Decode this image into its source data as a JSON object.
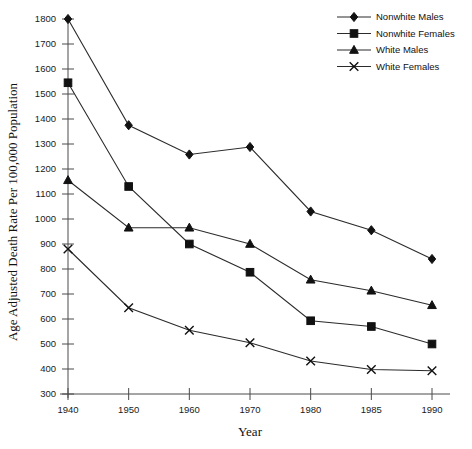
{
  "chart_data": {
    "type": "line",
    "title": "",
    "xlabel": "Year",
    "ylabel": "Age Adjusted Death Rate Per 100,000 Population",
    "categories": [
      "1940",
      "1950",
      "1960",
      "1970",
      "1980",
      "1985",
      "1990"
    ],
    "ylim": [
      300,
      1800
    ],
    "ytick_step": 100,
    "yticks": [
      "300",
      "400",
      "500",
      "600",
      "700",
      "800",
      "900",
      "1000",
      "1100",
      "1200",
      "1300",
      "1400",
      "1500",
      "1600",
      "1700",
      "1800"
    ],
    "grid": false,
    "legend_position": "top-right",
    "series": [
      {
        "name": "Nonwhite Males",
        "marker": "diamond",
        "values": [
          1800,
          1375,
          1258,
          1288,
          1030,
          955,
          840
        ]
      },
      {
        "name": "Nonwhite Females",
        "marker": "square",
        "values": [
          1545,
          1130,
          900,
          787,
          593,
          570,
          500
        ]
      },
      {
        "name": "White Males",
        "marker": "triangle",
        "values": [
          1155,
          965,
          965,
          900,
          757,
          713,
          655
        ]
      },
      {
        "name": "White Females",
        "marker": "x",
        "values": [
          880,
          645,
          555,
          505,
          432,
          398,
          393
        ]
      }
    ]
  },
  "legend": {
    "items": [
      {
        "label": "Nonwhite Males",
        "marker": "diamond"
      },
      {
        "label": "Nonwhite Females",
        "marker": "square"
      },
      {
        "label": "White Males",
        "marker": "triangle"
      },
      {
        "label": "White Females",
        "marker": "x"
      }
    ]
  },
  "colors": {
    "line": "#2b2b2b",
    "marker": "#111111",
    "axis": "#4a4a4a",
    "background": "#ffffff"
  }
}
